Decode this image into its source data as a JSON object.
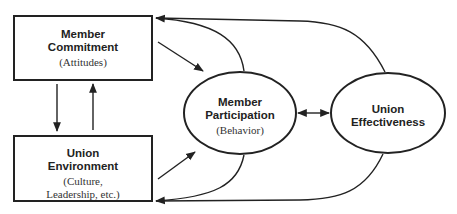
{
  "diagram": {
    "nodes": [
      {
        "id": "commitment",
        "shape": "rectangle",
        "title": "Member Commitment",
        "title_lines": [
          "Member",
          "Commitment"
        ],
        "subtitle": "(Attitudes)",
        "subtitle_lines": [
          "(Attitudes)"
        ]
      },
      {
        "id": "environment",
        "shape": "rectangle",
        "title": "Union Environment",
        "title_lines": [
          "Union",
          "Environment"
        ],
        "subtitle": "(Culture, Leadership, etc.)",
        "subtitle_lines": [
          "(Culture,",
          "Leadership, etc.)"
        ]
      },
      {
        "id": "participation",
        "shape": "ellipse",
        "title": "Member Participation",
        "title_lines": [
          "Member",
          "Participation"
        ],
        "subtitle": "(Behavior)",
        "subtitle_lines": [
          "(Behavior)"
        ]
      },
      {
        "id": "effectiveness",
        "shape": "ellipse",
        "title": "Union Effectiveness",
        "title_lines": [
          "Union",
          "Effectiveness"
        ],
        "subtitle": "",
        "subtitle_lines": []
      }
    ],
    "edges": [
      {
        "from": "commitment",
        "to": "participation",
        "type": "straight"
      },
      {
        "from": "environment",
        "to": "participation",
        "type": "straight"
      },
      {
        "from": "commitment",
        "to": "environment",
        "type": "straight"
      },
      {
        "from": "environment",
        "to": "commitment",
        "type": "straight"
      },
      {
        "from": "participation",
        "to": "effectiveness",
        "type": "bidirectional"
      },
      {
        "from": "participation",
        "to": "commitment",
        "type": "curved"
      },
      {
        "from": "effectiveness",
        "to": "commitment",
        "type": "curved"
      },
      {
        "from": "participation",
        "to": "environment",
        "type": "curved"
      },
      {
        "from": "effectiveness",
        "to": "environment",
        "type": "curved"
      }
    ],
    "colors": {
      "stroke": "#222222",
      "background": "#ffffff",
      "text": "#222222"
    }
  }
}
